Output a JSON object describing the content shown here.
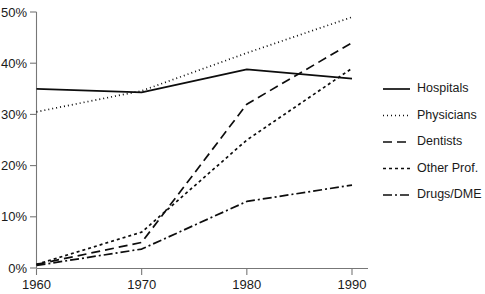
{
  "chart_data": {
    "type": "line",
    "title": "",
    "subtitle": "",
    "xlabel": "",
    "ylabel": "",
    "x": [
      1960,
      1970,
      1980,
      1990
    ],
    "xlim": [
      1960,
      1990
    ],
    "ylim": [
      0,
      50
    ],
    "grid": false,
    "legend_position": "right",
    "x_tick_labels": [
      "1960",
      "1970",
      "1980",
      "1990"
    ],
    "y_tick_labels": [
      "0%",
      "10%",
      "20%",
      "30%",
      "40%",
      "50%"
    ],
    "y_tick_values": [
      0,
      10,
      20,
      30,
      40,
      50
    ],
    "series": [
      {
        "name": "Hospitals",
        "style": "solid",
        "dash": "none",
        "color": "#0d0d0d",
        "values": [
          35.0,
          34.3,
          38.8,
          37.0
        ]
      },
      {
        "name": "Physicians",
        "style": "dotted",
        "dash": "1,3",
        "color": "#0d0d0d",
        "values": [
          30.5,
          34.6,
          42.0,
          49.0
        ]
      },
      {
        "name": "Dentists",
        "style": "dashed",
        "dash": "9,5",
        "color": "#0d0d0d",
        "values": [
          0.7,
          5.0,
          32.0,
          44.0
        ]
      },
      {
        "name": "Other Prof.",
        "style": "fine-dashed",
        "dash": "3,3",
        "color": "#0d0d0d",
        "values": [
          0.7,
          7.0,
          25.0,
          39.0
        ]
      },
      {
        "name": "Drugs/DME",
        "style": "dash-dot",
        "dash": "9,3,2,3",
        "color": "#0d0d0d",
        "values": [
          0.5,
          3.7,
          13.0,
          16.2
        ]
      }
    ]
  },
  "legend": {
    "items": [
      {
        "label": "Hospitals"
      },
      {
        "label": "Physicians"
      },
      {
        "label": "Dentists"
      },
      {
        "label": "Other Prof."
      },
      {
        "label": "Drugs/DME"
      }
    ]
  }
}
